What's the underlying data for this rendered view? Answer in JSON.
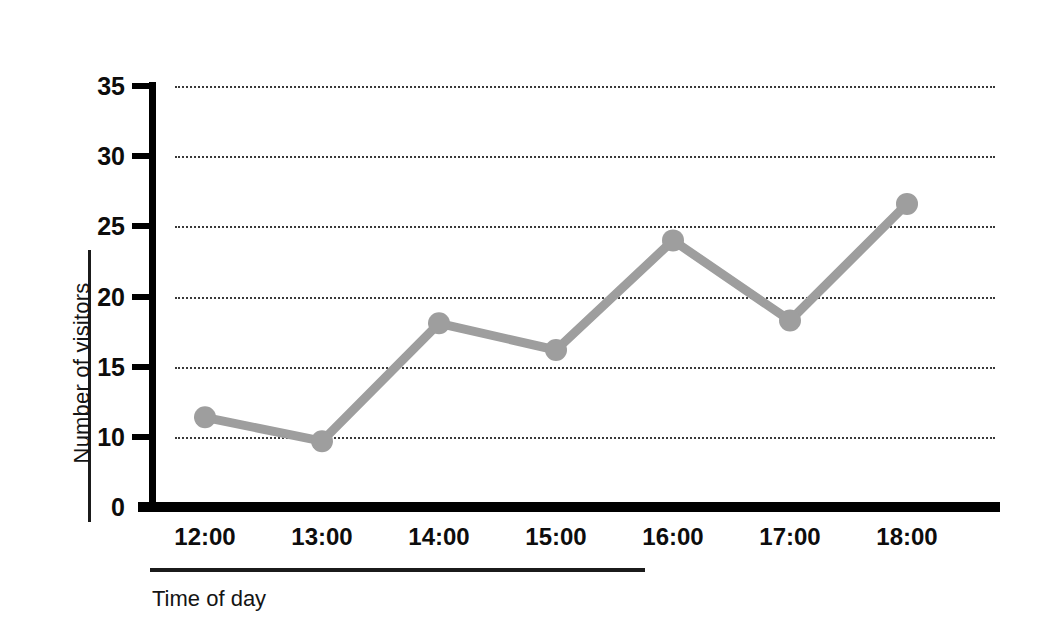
{
  "chart_data": {
    "type": "line",
    "title": "",
    "subtitle": "",
    "xlabel": "Time of day",
    "ylabel": "Number of visitors",
    "categories": [
      "12:00",
      "13:00",
      "14:00",
      "15:00",
      "16:00",
      "17:00",
      "18:00"
    ],
    "x": [
      "12:00",
      "13:00",
      "14:00",
      "15:00",
      "16:00",
      "17:00",
      "18:00"
    ],
    "values": [
      11.4,
      9.7,
      18.1,
      16.2,
      24.0,
      18.3,
      26.6
    ],
    "series": [
      {
        "name": "Number of visitors",
        "values": [
          11.4,
          9.7,
          18.1,
          16.2,
          24.0,
          18.3,
          26.6
        ],
        "color": "#9e9e9e",
        "marker": "circle",
        "line_width": 9
      }
    ],
    "ylim": [
      0,
      35
    ],
    "y_ticks": [
      0,
      10,
      15,
      20,
      25,
      30,
      35
    ],
    "y_tick_labels": [
      "0",
      "10",
      "15",
      "20",
      "25",
      "30",
      "35"
    ],
    "y_axis_break": true,
    "y_axis_break_note": "no tick at 5; scale jumps from 0 to 10",
    "x_tick_labels": [
      "12:00",
      "13:00",
      "14:00",
      "15:00",
      "16:00",
      "17:00",
      "18:00"
    ],
    "grid": true,
    "grid_style": "dotted",
    "grid_axis": "y",
    "legend": false,
    "legend_position": "none",
    "annotations": [],
    "background_color": "#ffffff",
    "axis_color": "#000000",
    "grid_color": "#3a3a3a"
  },
  "axes": {
    "y_title": "Number of visitors",
    "x_title": "Time of day"
  }
}
